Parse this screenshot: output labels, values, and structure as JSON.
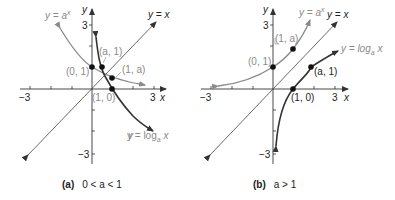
{
  "panels": [
    {
      "id": "a",
      "caption_label": "(a)",
      "caption_condition": "0 < a < 1",
      "axis_labels": {
        "x": "x",
        "y": "y",
        "x_neg": "−3",
        "x_pos": "3",
        "y_pos": "3",
        "y_neg": "−3"
      },
      "curves": {
        "exp_label": "y = a",
        "exp_sup": "x",
        "identity_label": "y = x",
        "log_label": "y = log",
        "log_sub": "a",
        "log_var": " x"
      },
      "points": [
        {
          "label": "(0, 1)"
        },
        {
          "label": "(a, 1)"
        },
        {
          "label": "(1, a)"
        },
        {
          "label": "(1, 0)"
        }
      ]
    },
    {
      "id": "b",
      "caption_label": "(b)",
      "caption_condition": "a > 1",
      "axis_labels": {
        "x": "x",
        "y": "y",
        "x_neg": "−3",
        "x_pos": "3",
        "y_pos": "3",
        "y_neg": "−3"
      },
      "curves": {
        "exp_label": "y = a",
        "exp_sup": "x",
        "identity_label": "y = x",
        "log_label": "y = log",
        "log_sub": "a",
        "log_var": " x"
      },
      "points": [
        {
          "label": "(0, 1)"
        },
        {
          "label": "(1, a)"
        },
        {
          "label": "(a, 1)"
        },
        {
          "label": "(1, 0)"
        }
      ]
    }
  ],
  "colors": {
    "exp_curve": "#8a8a8a",
    "log_curve": "#333333",
    "axis": "#333333",
    "identity": "#444444"
  }
}
